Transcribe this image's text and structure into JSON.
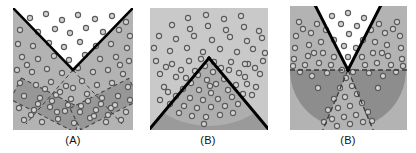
{
  "figure": {
    "type": "diagram",
    "background_color": "#ffffff",
    "width": 416,
    "height": 153,
    "colors": {
      "square_fill": "#b3b3b3",
      "region_light": "#c4c4c4",
      "region_dark": "#8f8f8f",
      "strip_fill": "#8f8f8f",
      "white_region": "#ffffff",
      "boundary_solid": "#000000",
      "boundary_dashed": "#3a3a3a",
      "point_stroke": "#555555",
      "point_fill": "#cfcfcf",
      "caption_color": "#111111"
    },
    "panels": [
      {
        "id": "panel-a",
        "caption": "(A)",
        "caption_x": 73,
        "caption_y": 134,
        "square": {
          "x": 13,
          "y": 8,
          "w": 120,
          "h": 122
        },
        "solid_boundaries": [
          {
            "name": "left-v-arm",
            "x1": 13,
            "y1": 8,
            "x2": 73,
            "y2": 70
          },
          {
            "name": "right-v-arm",
            "x1": 73,
            "y1": 70,
            "x2": 133,
            "y2": 8
          }
        ],
        "white_wedge": "upper V wedge between the two solid lines",
        "dashed_strips": [
          {
            "name": "left-strip",
            "angle_deg": 28
          },
          {
            "name": "right-strip",
            "angle_deg": -28
          }
        ],
        "point_count": 86
      },
      {
        "id": "panel-b-middle",
        "caption": "(B)",
        "caption_x": 208,
        "caption_y": 134,
        "square": {
          "x": 150,
          "y": 8,
          "w": 118,
          "h": 122
        },
        "solid_boundaries": [
          {
            "name": "left-triangle-arm",
            "x1": 150,
            "y1": 130,
            "x2": 209,
            "y2": 60
          },
          {
            "name": "right-triangle-arm",
            "x1": 209,
            "y1": 60,
            "x2": 268,
            "y2": 130
          }
        ],
        "dark_triangle": "apex-up triangle filled dark gray",
        "light_arc": "lighter circular arc band across the triangle base",
        "point_count": 84
      },
      {
        "id": "panel-b-right",
        "caption": "(B)",
        "caption_x": 348,
        "caption_y": 134,
        "square": {
          "x": 290,
          "y": 6,
          "w": 117,
          "h": 124
        },
        "solid_boundaries": [
          {
            "name": "left-v-arm",
            "x1": 316,
            "y1": 6,
            "x2": 348,
            "y2": 70
          },
          {
            "name": "right-v-arm",
            "x1": 348,
            "y1": 70,
            "x2": 380,
            "y2": 6
          }
        ],
        "dashed_boundaries": [
          {
            "name": "horizontal-split",
            "x1": 290,
            "y1": 70,
            "x2": 407,
            "y2": 70
          },
          {
            "name": "lower-left-wedge-arm",
            "x1": 348,
            "y1": 70,
            "x2": 326,
            "y2": 126
          },
          {
            "name": "lower-right-wedge-arm",
            "x1": 348,
            "y1": 70,
            "x2": 370,
            "y2": 126
          }
        ],
        "dark_semicircle": "lower half-disc in dark gray with a lighter wedge removed",
        "point_count": 78
      }
    ]
  }
}
